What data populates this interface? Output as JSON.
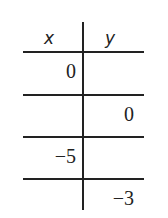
{
  "table": {
    "headers": {
      "x": "x",
      "y": "y"
    },
    "rows": [
      {
        "x": "0",
        "y": ""
      },
      {
        "x": "",
        "y": "0"
      },
      {
        "x": "−5",
        "y": ""
      },
      {
        "x": "",
        "y": "−3"
      }
    ]
  }
}
